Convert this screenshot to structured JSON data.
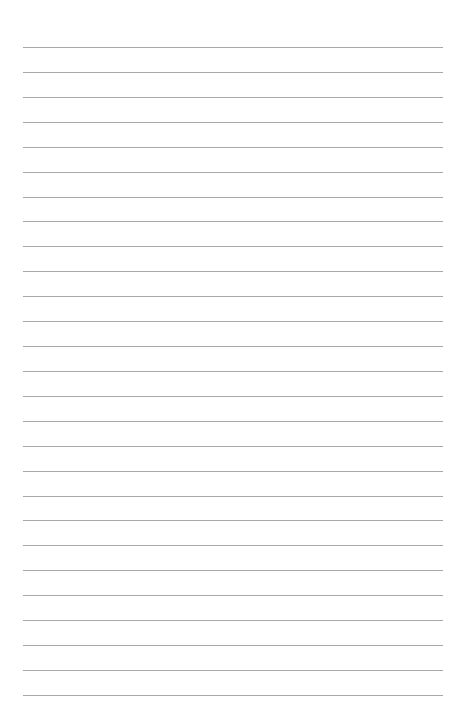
{
  "page": {
    "type": "lined-paper",
    "background_color": "#ffffff",
    "line_color": "#a8a8a8",
    "line_count": 27,
    "first_line_y": 47,
    "line_spacing": 24.92,
    "line_left": 23,
    "line_right": 443
  }
}
